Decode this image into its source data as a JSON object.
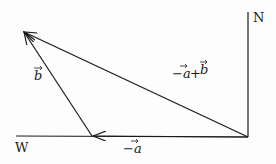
{
  "diagram": {
    "type": "vector-addition",
    "compass": {
      "north_label": "N",
      "west_label": "W"
    },
    "vectors": [
      {
        "label": "-a⃗",
        "text": "−a",
        "from": "origin",
        "to": "point-A"
      },
      {
        "label": "b⃗",
        "text": "b",
        "from": "point-A",
        "to": "point-B"
      },
      {
        "label": "-a⃗+b⃗",
        "text": "−a + b",
        "from": "origin",
        "to": "point-B"
      }
    ],
    "labels": {
      "north": "N",
      "west": "W",
      "neg_a": "−a",
      "b": "b",
      "sum_neg": "−a",
      "sum_plus": "+",
      "sum_b": "b"
    },
    "colors": {
      "stroke": "#1a1a1a",
      "background": "#fdfdfd"
    }
  }
}
